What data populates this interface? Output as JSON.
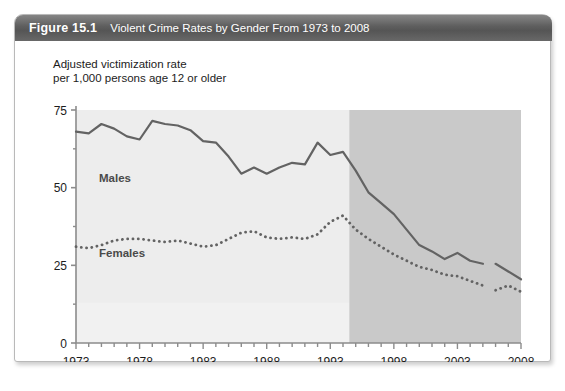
{
  "figure": {
    "number": "Figure 15.1",
    "title": "Violent Crime Rates by Gender From 1973 to 2008"
  },
  "chart_data": {
    "type": "line",
    "title": "Violent Crime Rates by Gender From 1973 to 2008",
    "subtitle": "",
    "axis_title": "Adjusted victimization rate\nper 1,000 persons age 12 or older",
    "xlabel": "",
    "ylabel": "Adjusted victimization rate per 1,000 persons age 12 or older",
    "xlim": [
      1973,
      2008
    ],
    "ylim": [
      0,
      75
    ],
    "yticks": [
      0,
      25,
      50,
      75
    ],
    "ytick_labels": [
      "0",
      "25",
      "50",
      "75"
    ],
    "xticks": [
      1973,
      1978,
      1983,
      1988,
      1993,
      1998,
      2003,
      2008
    ],
    "xtick_labels": [
      "1973",
      "1978",
      "1983",
      "1988",
      "1993",
      "1998",
      "2003",
      "2008"
    ],
    "minor_xticks_every": 1,
    "grid": false,
    "legend_position": "inline-annotation",
    "shaded_region": {
      "label": "redesigned-survey-period",
      "x_start": 1994.5,
      "x_end": 2008,
      "color": "#c9c9c9"
    },
    "plot_background": "#ededed",
    "x": [
      1973,
      1974,
      1975,
      1976,
      1977,
      1978,
      1979,
      1980,
      1981,
      1982,
      1983,
      1984,
      1985,
      1986,
      1987,
      1988,
      1989,
      1990,
      1991,
      1992,
      1993,
      1994,
      1995,
      1996,
      1997,
      1998,
      1999,
      2000,
      2001,
      2002,
      2003,
      2004,
      2005,
      2006,
      2007,
      2008
    ],
    "series": [
      {
        "name": "Males",
        "label": "Males",
        "color": "#636363",
        "style": "solid",
        "break_after_index": 32,
        "values": [
          68,
          67.5,
          70.5,
          69,
          66.5,
          65.5,
          71.5,
          70.5,
          70,
          68.5,
          65,
          64.5,
          60,
          54.5,
          56.5,
          54.5,
          56.5,
          58,
          57.5,
          64.5,
          60.5,
          61.5,
          55.5,
          48.5,
          45,
          41.5,
          36.5,
          31.5,
          29.5,
          27,
          29,
          26.5,
          25.5,
          25.5,
          23,
          20.5
        ]
      },
      {
        "name": "Females",
        "label": "Females",
        "color": "#636363",
        "style": "dotted",
        "break_after_index": 32,
        "values": [
          31,
          30.5,
          31.5,
          33,
          33.5,
          33.5,
          33,
          32.5,
          33,
          32,
          31,
          31.5,
          33.5,
          35.5,
          36,
          34,
          33.5,
          34,
          33.5,
          35,
          39,
          41,
          36.5,
          33.5,
          31,
          28.5,
          26.5,
          24.5,
          23.5,
          22,
          21.5,
          20,
          18.5,
          17,
          18.5,
          16.5
        ]
      }
    ]
  }
}
